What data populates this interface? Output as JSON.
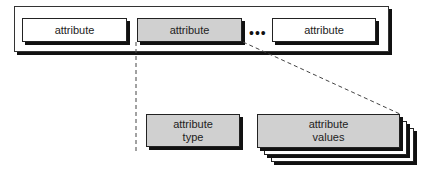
{
  "diagram": {
    "container": {
      "attributes": [
        {
          "label": "attribute",
          "fill": "#ffffff"
        },
        {
          "label": "attribute",
          "fill": "#d0d0d0"
        },
        {
          "label": "attribute",
          "fill": "#ffffff"
        }
      ],
      "ellipsis": "•••"
    },
    "details": {
      "type_box": {
        "line1": "attribute",
        "line2": "type",
        "fill": "#d0d0d0"
      },
      "values_box": {
        "line1": "attribute",
        "line2": "values",
        "fill": "#d0d0d0",
        "stack_count": 3
      }
    }
  }
}
